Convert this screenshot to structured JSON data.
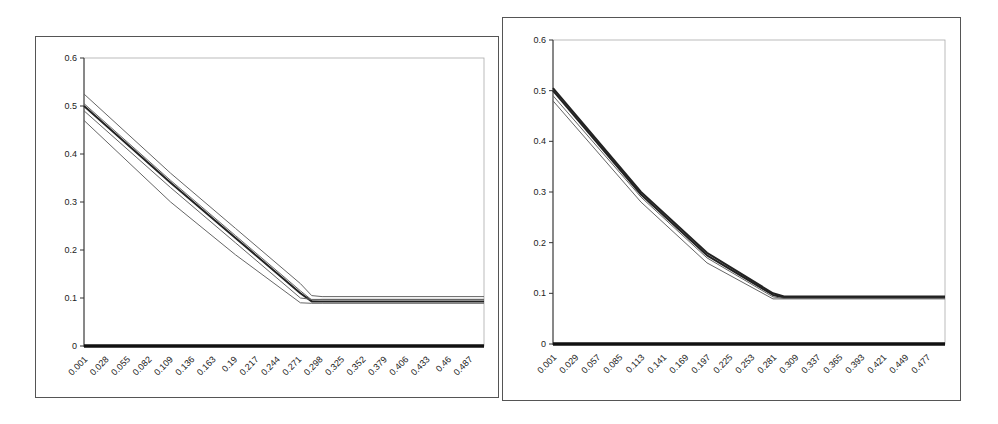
{
  "chart_data": [
    {
      "type": "line",
      "title": "",
      "xlabel": "",
      "ylabel": "",
      "ylim": [
        0,
        0.6
      ],
      "yticks": [
        "0",
        "0.1",
        "0.2",
        "0.3",
        "0.4",
        "0.5",
        "0.6"
      ],
      "xtick_labels": [
        "0.001",
        "0.028",
        "0.055",
        "0.082",
        "0.109",
        "0.136",
        "0.163",
        "0.19",
        "0.217",
        "0.244",
        "0.271",
        "0.298",
        "0.325",
        "0.352",
        "0.379",
        "0.406",
        "0.433",
        "0.46",
        "0.487"
      ],
      "grid": false,
      "legend": "none",
      "x": [
        0.001,
        0.109,
        0.19,
        0.271,
        0.285,
        0.298,
        0.5
      ],
      "series": [
        {
          "name": "upper band",
          "values": [
            0.525,
            0.36,
            0.245,
            0.13,
            0.105,
            0.103,
            0.103
          ]
        },
        {
          "name": "series 2",
          "values": [
            0.505,
            0.345,
            0.23,
            0.115,
            0.096,
            0.097,
            0.097
          ]
        },
        {
          "name": "mean",
          "values": [
            0.5,
            0.34,
            0.225,
            0.11,
            0.093,
            0.093,
            0.093
          ]
        },
        {
          "name": "series 4",
          "values": [
            0.49,
            0.33,
            0.215,
            0.1,
            0.097,
            0.097,
            0.097
          ]
        },
        {
          "name": "lower band",
          "values": [
            0.47,
            0.3,
            0.19,
            0.09,
            0.089,
            0.089,
            0.089
          ]
        },
        {
          "name": "zero line",
          "values": [
            0,
            0,
            0,
            0,
            0,
            0,
            0
          ]
        }
      ]
    },
    {
      "type": "line",
      "title": "",
      "xlabel": "",
      "ylabel": "",
      "ylim": [
        0,
        0.6
      ],
      "yticks": [
        "0",
        "0.1",
        "0.2",
        "0.3",
        "0.4",
        "0.5",
        "0.6"
      ],
      "xtick_labels": [
        "0.001",
        "0.029",
        "0.057",
        "0.085",
        "0.113",
        "0.141",
        "0.169",
        "0.197",
        "0.225",
        "0.253",
        "0.281",
        "0.309",
        "0.337",
        "0.365",
        "0.393",
        "0.421",
        "0.449",
        "0.477"
      ],
      "grid": false,
      "legend": "none",
      "x": [
        0.001,
        0.113,
        0.197,
        0.281,
        0.295,
        0.5
      ],
      "series": [
        {
          "name": "series 1",
          "values": [
            0.505,
            0.3,
            0.18,
            0.1,
            0.094,
            0.094
          ]
        },
        {
          "name": "series 2",
          "values": [
            0.5,
            0.295,
            0.175,
            0.097,
            0.092,
            0.092
          ]
        },
        {
          "name": "series 3",
          "values": [
            0.49,
            0.29,
            0.17,
            0.093,
            0.09,
            0.09
          ]
        },
        {
          "name": "series 4",
          "values": [
            0.48,
            0.28,
            0.16,
            0.089,
            0.089,
            0.089
          ]
        },
        {
          "name": "zero line",
          "values": [
            0,
            0,
            0,
            0,
            0,
            0
          ]
        }
      ]
    }
  ],
  "charts": {
    "left": {
      "yticks": [
        "0",
        "0.1",
        "0.2",
        "0.3",
        "0.4",
        "0.5",
        "0.6"
      ],
      "xticks": [
        "0.001",
        "0.028",
        "0.055",
        "0.082",
        "0.109",
        "0.136",
        "0.163",
        "0.19",
        "0.217",
        "0.244",
        "0.271",
        "0.298",
        "0.325",
        "0.352",
        "0.379",
        "0.406",
        "0.433",
        "0.46",
        "0.487"
      ]
    },
    "right": {
      "yticks": [
        "0",
        "0.1",
        "0.2",
        "0.3",
        "0.4",
        "0.5",
        "0.6"
      ],
      "xticks": [
        "0.001",
        "0.029",
        "0.057",
        "0.085",
        "0.113",
        "0.141",
        "0.169",
        "0.197",
        "0.225",
        "0.253",
        "0.281",
        "0.309",
        "0.337",
        "0.365",
        "0.393",
        "0.421",
        "0.449",
        "0.477"
      ]
    }
  }
}
